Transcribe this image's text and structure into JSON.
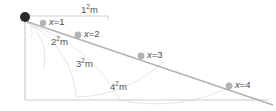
{
  "figure": {
    "type": "geometry-diagram",
    "width": 276,
    "height": 111,
    "background": "#ffffff",
    "colors": {
      "source_dot": "#2b2b2b",
      "point_dot": "#b3b3b3",
      "ray_line": "#b0b0b0",
      "axis_line": "#c9c9c9",
      "arc_line": "#dcdcdc",
      "text": "#555555"
    },
    "source": {
      "name": "source-point",
      "x": 25,
      "y": 17,
      "radius": 5
    },
    "axes": {
      "vertical": {
        "x": 25,
        "y1": 20,
        "y2": 100
      },
      "horizontal": {
        "y": 100,
        "x1": 25,
        "x2": 268
      },
      "top_measure": {
        "y": 17,
        "x1": 30,
        "x2": 108
      }
    },
    "ray": {
      "x1": 25,
      "y1": 21,
      "x2": 272,
      "y2": 104
    },
    "points": [
      {
        "name": "point-x1",
        "label_var": "x",
        "label_eq": "=",
        "label_val": "1",
        "cx": 43,
        "cy": 23,
        "r": 3.2,
        "label_x": 50,
        "label_y": 17
      },
      {
        "name": "point-x2",
        "label_var": "x",
        "label_eq": "=",
        "label_val": "2",
        "cx": 78,
        "cy": 35,
        "r": 3.4,
        "label_x": 85,
        "label_y": 29
      },
      {
        "name": "point-x3",
        "label_var": "x",
        "label_eq": "=",
        "label_val": "3",
        "cx": 141,
        "cy": 56,
        "r": 3.4,
        "label_x": 148,
        "label_y": 50
      },
      {
        "name": "point-x4",
        "label_var": "x",
        "label_eq": "=",
        "label_val": "4",
        "cx": 229,
        "cy": 86,
        "r": 3.4,
        "label_x": 236,
        "label_y": 80
      }
    ],
    "distance_labels": [
      {
        "name": "distance-label-1",
        "base": "1",
        "exp": "2",
        "unit": "m",
        "x": 81,
        "y": 6
      },
      {
        "name": "distance-label-2",
        "base": "2",
        "exp": "2",
        "unit": "m",
        "x": 51,
        "y": 37
      },
      {
        "name": "distance-label-3",
        "base": "3",
        "exp": "2",
        "unit": "m",
        "x": 76,
        "y": 59
      },
      {
        "name": "distance-label-4",
        "base": "4",
        "exp": "2",
        "unit": "m",
        "x": 110,
        "y": 83
      }
    ],
    "arcs": [
      {
        "name": "arc-1",
        "d": "M 27 22 A 20 20 0 0 1 31 39"
      },
      {
        "name": "arc-2",
        "d": "M 29 23 A 46 46 0 0 1 43 68"
      },
      {
        "name": "arc-3",
        "d": "M 30 24 A 92 92 0 0 1 75 96"
      },
      {
        "name": "arc-4",
        "d": "M 31 25 A 160 160 0 0 1 119 99"
      },
      {
        "name": "arc-5",
        "d": "M 75 96 A 120 120 0 0 0 160 62"
      },
      {
        "name": "arc-6",
        "d": "M 119 99 A 150 150 0 0 0 232 86"
      }
    ]
  }
}
